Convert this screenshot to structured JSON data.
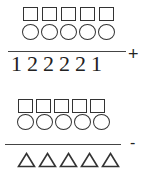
{
  "puzzle_top": {
    "row_squares_count": 5,
    "row_circles_count": 5,
    "bottom_digits": [
      "1",
      "2",
      "2",
      "2",
      "2",
      "1"
    ],
    "operator": "+"
  },
  "puzzle_bottom": {
    "row_squares_count": 5,
    "row_circles_count": 5,
    "bottom_triangles_count": 5,
    "operator": "-"
  },
  "symbols": {
    "square": "□",
    "circle": "○",
    "triangle": "△"
  }
}
